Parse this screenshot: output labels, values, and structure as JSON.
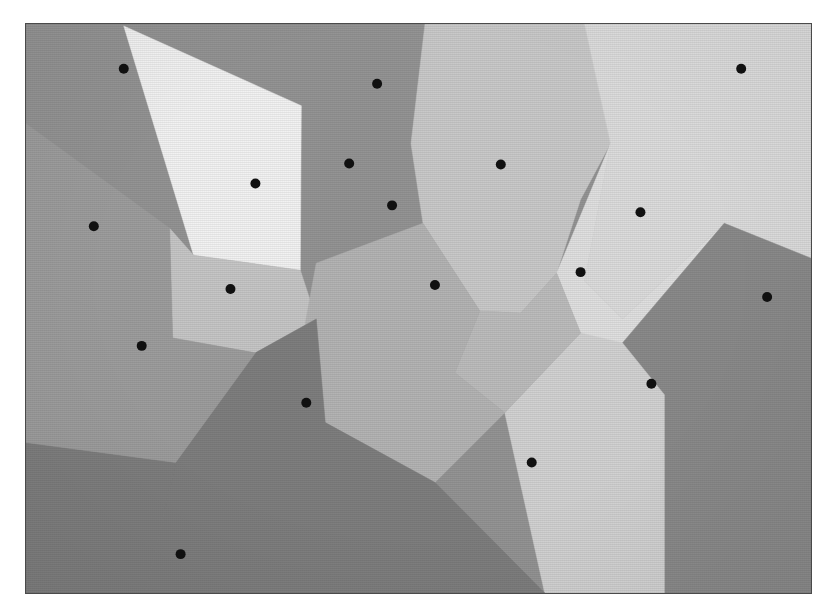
{
  "figure": {
    "caption": "",
    "frame": {
      "x": 25,
      "y": 23,
      "width": 787,
      "height": 571,
      "border_color": "#4a4a4a",
      "background_color": "#8d8d8d"
    },
    "canvas": {
      "width": 837,
      "height": 616,
      "background_color": "#ffffff"
    }
  },
  "chart_data": {
    "type": "scatter",
    "subtitle": "",
    "xlabel": "",
    "ylabel": "",
    "xlim": [
      0,
      787
    ],
    "ylim": [
      0,
      571
    ],
    "grid": false,
    "legend": "none",
    "marker": {
      "shape": "circle",
      "radius": 5,
      "color": "#111111"
    },
    "site_count": 18,
    "region_count": 18,
    "palette": [
      "#f2f2f2",
      "#e3e3e3",
      "#d8d8d8",
      "#cfcfcf",
      "#c4c4c4",
      "#b9b9b9",
      "#ababab",
      "#9d9d9d",
      "#929292",
      "#868686",
      "#7b7b7b"
    ],
    "sites": [
      {
        "id": 1,
        "x": 98,
        "y": 45,
        "label": "site-1",
        "fill": "#949494"
      },
      {
        "id": 2,
        "x": 230,
        "y": 160,
        "label": "site-2",
        "fill": "#f2f2f2"
      },
      {
        "id": 3,
        "x": 324,
        "y": 140,
        "label": "site-3",
        "fill": "#949494"
      },
      {
        "id": 4,
        "x": 367,
        "y": 182,
        "label": "site-4",
        "fill": "#949494"
      },
      {
        "id": 5,
        "x": 68,
        "y": 203,
        "label": "site-5",
        "fill": "#9d9d9d"
      },
      {
        "id": 6,
        "x": 205,
        "y": 266,
        "label": "site-6",
        "fill": "#c6c6c6"
      },
      {
        "id": 7,
        "x": 116,
        "y": 323,
        "label": "site-7",
        "fill": "#9d9d9d"
      },
      {
        "id": 8,
        "x": 281,
        "y": 380,
        "label": "site-8",
        "fill": "#7e7e7e"
      },
      {
        "id": 9,
        "x": 155,
        "y": 532,
        "label": "site-9",
        "fill": "#7e7e7e"
      },
      {
        "id": 10,
        "x": 410,
        "y": 262,
        "label": "site-10",
        "fill": "#b4b4b4"
      },
      {
        "id": 11,
        "x": 476,
        "y": 141,
        "label": "site-11",
        "fill": "#c9c9c9"
      },
      {
        "id": 12,
        "x": 507,
        "y": 440,
        "label": "site-12",
        "fill": "#7e7e7e"
      },
      {
        "id": 13,
        "x": 556,
        "y": 249,
        "label": "site-13",
        "fill": "#bcbcbc"
      },
      {
        "id": 14,
        "x": 616,
        "y": 189,
        "label": "site-14",
        "fill": "#dcdcdc"
      },
      {
        "id": 15,
        "x": 717,
        "y": 45,
        "label": "site-15",
        "fill": "#dcdcdc"
      },
      {
        "id": 16,
        "x": 743,
        "y": 274,
        "label": "site-16",
        "fill": "#8a8a8a"
      },
      {
        "id": 17,
        "x": 627,
        "y": 361,
        "label": "site-17",
        "fill": "#d2d2d2"
      },
      {
        "id": 18,
        "x": 352,
        "y": 60,
        "label": "site-18",
        "fill": "#949494"
      }
    ],
    "regions": [
      {
        "id": "r-bg",
        "site": 1,
        "fill": "#949494",
        "points": "0,0 787,0 787,571 0,571"
      },
      {
        "id": "r-11",
        "site": 11,
        "fill": "#c9c9c9",
        "points": "400,0 560,0 586,120 556,176 532,250 496,290 455,288 398,200 386,120"
      },
      {
        "id": "r-15",
        "site": 15,
        "fill": "#dcdcdc",
        "points": "560,0 787,0 787,235 700,200 598,296 560,258 586,120"
      },
      {
        "id": "r-14",
        "site": 14,
        "fill": "#e0e0e0",
        "points": "586,120 560,258 598,296 700,200 787,235 787,250 640,372 556,310 532,250"
      },
      {
        "id": "r-16",
        "site": 16,
        "fill": "#8a8a8a",
        "points": "787,235 787,571 640,571 598,320 700,200"
      },
      {
        "id": "r-17",
        "site": 17,
        "fill": "#d2d2d2",
        "points": "640,372 598,320 556,310 480,390 520,571 640,571"
      },
      {
        "id": "r-2",
        "site": 2,
        "fill": "#f2f2f2",
        "points": "98,2 168,232 275,247 276,82"
      },
      {
        "id": "r-6",
        "site": 6,
        "fill": "#c6c6c6",
        "points": "144,205 168,232 275,247 291,296 230,330 147,315"
      },
      {
        "id": "r-13",
        "site": 13,
        "fill": "#bcbcbc",
        "points": "455,288 496,290 532,250 556,310 480,390 430,350"
      },
      {
        "id": "r-10",
        "site": 10,
        "fill": "#b4b4b4",
        "points": "291,240 398,200 455,288 430,350 480,390 410,460 300,400 280,300"
      },
      {
        "id": "r-8",
        "site": 8,
        "fill": "#7e7e7e",
        "points": "230,330 291,296 300,400 410,460 520,571 120,571 150,440"
      },
      {
        "id": "r-9",
        "site": 9,
        "fill": "#7e7e7e",
        "points": "0,420 150,440 120,571 0,571"
      },
      {
        "id": "r-7",
        "site": 7,
        "fill": "#9d9d9d",
        "points": "0,260 147,315 230,330 150,440 0,420"
      },
      {
        "id": "r-5",
        "site": 5,
        "fill": "#9d9d9d",
        "points": "0,100 144,205 147,315 0,260"
      }
    ],
    "annotations": []
  }
}
